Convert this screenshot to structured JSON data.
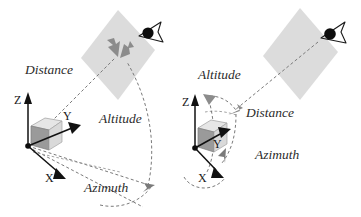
{
  "figure": {
    "panels": [
      {
        "id": "left",
        "name": "object-centered-view",
        "labels": {
          "distance": "Distance",
          "altitude": "Altitude",
          "azimuth": "Azimuth"
        },
        "axes": {
          "x": "X",
          "y": "Y",
          "z": "Z"
        },
        "elements": {
          "image_plane": "image-plane-quad",
          "camera": "eye-icon",
          "object": "cube-object",
          "origin": "origin-point"
        }
      },
      {
        "id": "right",
        "name": "angle-detail-view",
        "labels": {
          "distance": "Distance",
          "altitude": "Altitude",
          "azimuth": "Azimuth"
        },
        "axes": {
          "x": "X",
          "y": "Y",
          "z": "Z"
        },
        "elements": {
          "image_plane": "image-plane-quad",
          "camera": "eye-icon",
          "object": "cube-object",
          "origin": "origin-point"
        }
      }
    ],
    "colors": {
      "background": "#ffffff",
      "plane_fill": "#dcdcdc",
      "plane_fill_light": "#e2e2e2",
      "line": "#6b6b6b",
      "axis": "#111111",
      "text": "#2b2b2b",
      "cube_top": "#e8e8e8",
      "cube_front": "#d4d4d4",
      "cube_side": "#8f8f8f",
      "arrow_gray": "#8c8c8c"
    }
  }
}
